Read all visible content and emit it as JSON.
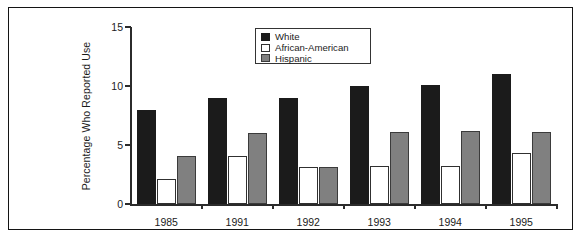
{
  "chart_data": {
    "type": "bar",
    "title": "",
    "xlabel": "",
    "ylabel": "Percentage Who Reported Use",
    "categories": [
      "1985",
      "1991",
      "1992",
      "1993",
      "1994",
      "1995"
    ],
    "ylim": [
      0,
      15
    ],
    "yticks": [
      0,
      5,
      10,
      15
    ],
    "ytick_labels": [
      "0",
      "5",
      "10",
      "15"
    ],
    "grid": false,
    "legend_position": "top-center",
    "series": [
      {
        "name": "White",
        "color": "#1b1b1b",
        "values": [
          8,
          9,
          9,
          10,
          10.1,
          11
        ]
      },
      {
        "name": "African-American",
        "color": "#ffffff",
        "values": [
          2.1,
          4.1,
          3.1,
          3.2,
          3.2,
          4.3
        ]
      },
      {
        "name": "Hispanic",
        "color": "#808080",
        "values": [
          4.1,
          6,
          3.1,
          6.1,
          6.2,
          6.1
        ]
      }
    ]
  },
  "legend": {
    "items": [
      {
        "label": "White",
        "swatch": "s-white"
      },
      {
        "label": "African-American",
        "swatch": "s-aa"
      },
      {
        "label": "Hispanic",
        "swatch": "s-hisp"
      }
    ]
  },
  "colors": {
    "series_white": "#1b1b1b",
    "series_african_american": "#ffffff",
    "series_hispanic": "#808080",
    "axis": "#2b2b2b",
    "frame": "#141414",
    "background": "#ffffff"
  }
}
